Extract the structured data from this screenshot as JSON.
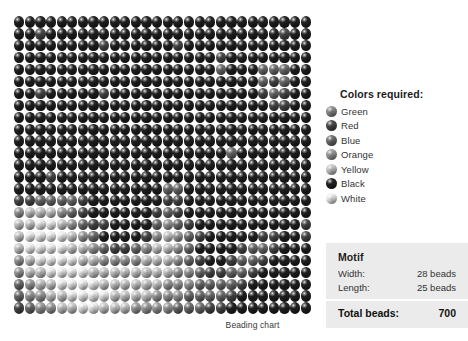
{
  "caption": "Beading chart",
  "legend": {
    "title": "Colors required:",
    "items": [
      {
        "label": "Green",
        "swatch": "bead-swatch-green",
        "tone": "#8c8c8c"
      },
      {
        "label": "Red",
        "swatch": "bead-swatch-red",
        "tone": "#4a4a4a"
      },
      {
        "label": "Blue",
        "swatch": "bead-swatch-blue",
        "tone": "#6e6e6e"
      },
      {
        "label": "Orange",
        "swatch": "bead-swatch-orange",
        "tone": "#9a9a9a"
      },
      {
        "label": "Yellow",
        "swatch": "bead-swatch-yellow",
        "tone": "#c8c8c8"
      },
      {
        "label": "Black",
        "swatch": "bead-swatch-black",
        "tone": "#222222"
      },
      {
        "label": "White",
        "swatch": "bead-swatch-white",
        "tone": "#ededed"
      }
    ]
  },
  "motif": {
    "title": "Motif",
    "width_label": "Width:",
    "width_value": "28 beads",
    "length_label": "Length:",
    "length_value": "25 beads",
    "total_label": "Total beads:",
    "total_value": "700"
  },
  "chart_data": {
    "type": "heatmap",
    "title": "Beading chart",
    "xlabel": "",
    "ylabel": "",
    "columns": 28,
    "rows": 25,
    "total_cells": 700,
    "palette": {
      "0": "#ededed",
      "1": "#c8c8c8",
      "2": "#9a9a9a",
      "3": "#6e6e6e",
      "4": "#4a4a4a",
      "5": "#222222"
    },
    "legend_position": "right",
    "grid": [
      [
        5,
        5,
        5,
        5,
        5,
        5,
        5,
        5,
        5,
        5,
        5,
        5,
        5,
        5,
        5,
        5,
        5,
        5,
        5,
        5,
        5,
        5,
        5,
        5,
        5,
        5,
        5,
        5
      ],
      [
        5,
        5,
        4,
        5,
        5,
        5,
        5,
        5,
        5,
        5,
        5,
        5,
        5,
        5,
        5,
        5,
        5,
        5,
        5,
        5,
        5,
        5,
        5,
        5,
        5,
        4,
        5,
        5
      ],
      [
        5,
        5,
        5,
        5,
        5,
        5,
        5,
        5,
        4,
        5,
        5,
        5,
        5,
        5,
        5,
        4,
        5,
        5,
        5,
        5,
        5,
        5,
        5,
        5,
        5,
        5,
        5,
        5
      ],
      [
        5,
        5,
        5,
        5,
        5,
        5,
        5,
        5,
        5,
        5,
        5,
        5,
        5,
        5,
        5,
        5,
        5,
        5,
        5,
        4,
        5,
        5,
        5,
        5,
        5,
        5,
        5,
        5
      ],
      [
        5,
        5,
        5,
        5,
        5,
        5,
        5,
        5,
        5,
        5,
        5,
        5,
        5,
        5,
        5,
        5,
        5,
        5,
        5,
        3,
        5,
        5,
        5,
        3,
        3,
        3,
        5,
        5
      ],
      [
        5,
        5,
        5,
        5,
        5,
        5,
        5,
        5,
        5,
        5,
        5,
        5,
        5,
        5,
        5,
        5,
        5,
        5,
        5,
        5,
        5,
        5,
        5,
        3,
        4,
        3,
        5,
        5
      ],
      [
        5,
        5,
        4,
        5,
        5,
        5,
        5,
        5,
        4,
        5,
        5,
        5,
        5,
        5,
        5,
        5,
        5,
        5,
        5,
        5,
        5,
        5,
        5,
        4,
        3,
        4,
        5,
        5
      ],
      [
        5,
        5,
        5,
        5,
        5,
        5,
        5,
        5,
        5,
        5,
        5,
        5,
        5,
        5,
        5,
        5,
        5,
        5,
        5,
        5,
        5,
        5,
        5,
        5,
        4,
        4,
        5,
        5
      ],
      [
        5,
        5,
        5,
        5,
        5,
        5,
        5,
        5,
        5,
        5,
        5,
        5,
        5,
        5,
        5,
        5,
        5,
        5,
        5,
        5,
        5,
        5,
        5,
        5,
        5,
        5,
        5,
        5
      ],
      [
        5,
        5,
        5,
        5,
        5,
        5,
        5,
        5,
        5,
        5,
        5,
        5,
        5,
        5,
        5,
        5,
        5,
        5,
        5,
        5,
        5,
        5,
        5,
        5,
        5,
        5,
        5,
        5
      ],
      [
        5,
        5,
        5,
        5,
        5,
        5,
        5,
        5,
        5,
        5,
        5,
        5,
        5,
        5,
        5,
        5,
        5,
        5,
        5,
        5,
        5,
        5,
        5,
        5,
        5,
        5,
        5,
        5
      ],
      [
        5,
        5,
        5,
        5,
        5,
        5,
        5,
        5,
        5,
        5,
        5,
        5,
        5,
        5,
        5,
        5,
        5,
        5,
        5,
        5,
        3,
        5,
        5,
        5,
        5,
        5,
        5,
        5
      ],
      [
        5,
        5,
        5,
        5,
        5,
        5,
        5,
        5,
        5,
        5,
        5,
        5,
        5,
        5,
        5,
        5,
        5,
        5,
        5,
        5,
        5,
        5,
        5,
        5,
        5,
        5,
        5,
        5
      ],
      [
        5,
        5,
        5,
        4,
        5,
        5,
        5,
        5,
        5,
        5,
        5,
        5,
        5,
        5,
        5,
        5,
        5,
        5,
        5,
        5,
        5,
        5,
        5,
        5,
        5,
        5,
        5,
        5
      ],
      [
        5,
        5,
        5,
        5,
        5,
        5,
        5,
        5,
        5,
        5,
        5,
        5,
        5,
        5,
        3,
        3,
        5,
        5,
        5,
        5,
        5,
        5,
        5,
        5,
        5,
        5,
        5,
        5
      ],
      [
        4,
        4,
        3,
        3,
        3,
        3,
        4,
        5,
        5,
        5,
        5,
        5,
        5,
        5,
        4,
        4,
        5,
        5,
        5,
        5,
        5,
        5,
        5,
        5,
        5,
        5,
        5,
        5
      ],
      [
        2,
        1,
        1,
        1,
        2,
        3,
        4,
        5,
        5,
        5,
        5,
        5,
        5,
        4,
        3,
        4,
        5,
        5,
        5,
        5,
        5,
        5,
        5,
        5,
        5,
        5,
        5,
        5
      ],
      [
        1,
        1,
        0,
        0,
        1,
        2,
        3,
        4,
        4,
        5,
        5,
        5,
        5,
        3,
        2,
        3,
        4,
        5,
        5,
        5,
        5,
        5,
        5,
        5,
        5,
        5,
        5,
        4
      ],
      [
        1,
        0,
        0,
        0,
        0,
        1,
        2,
        3,
        5,
        5,
        5,
        5,
        4,
        2,
        1,
        2,
        3,
        4,
        5,
        5,
        5,
        5,
        5,
        4,
        4,
        5,
        5,
        4
      ],
      [
        1,
        0,
        0,
        0,
        0,
        1,
        1,
        2,
        3,
        4,
        4,
        3,
        2,
        1,
        1,
        2,
        3,
        5,
        5,
        5,
        5,
        4,
        3,
        3,
        4,
        5,
        5,
        5
      ],
      [
        2,
        1,
        0,
        0,
        0,
        0,
        1,
        1,
        2,
        2,
        2,
        2,
        1,
        1,
        1,
        2,
        3,
        4,
        5,
        5,
        4,
        3,
        3,
        4,
        5,
        5,
        5,
        5
      ],
      [
        2,
        1,
        1,
        0,
        0,
        0,
        0,
        1,
        1,
        1,
        1,
        1,
        1,
        1,
        1,
        2,
        2,
        3,
        4,
        4,
        3,
        3,
        4,
        5,
        5,
        5,
        5,
        5
      ],
      [
        3,
        2,
        1,
        1,
        0,
        0,
        0,
        0,
        1,
        1,
        1,
        1,
        1,
        1,
        2,
        2,
        2,
        3,
        3,
        3,
        3,
        4,
        5,
        5,
        5,
        5,
        5,
        5
      ],
      [
        3,
        2,
        2,
        1,
        1,
        0,
        0,
        0,
        0,
        1,
        1,
        1,
        1,
        2,
        2,
        2,
        3,
        3,
        3,
        3,
        4,
        5,
        5,
        5,
        5,
        5,
        5,
        5
      ],
      [
        4,
        3,
        2,
        2,
        1,
        1,
        0,
        0,
        1,
        1,
        1,
        2,
        2,
        2,
        2,
        3,
        3,
        3,
        4,
        4,
        5,
        5,
        5,
        5,
        5,
        5,
        5,
        5
      ]
    ]
  }
}
